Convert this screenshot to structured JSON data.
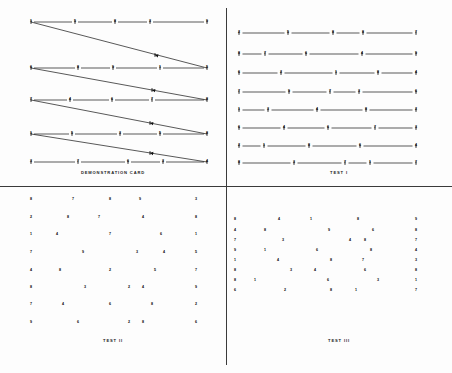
{
  "page": {
    "background": "#fdfdfd",
    "ink": "#111111"
  },
  "panels": {
    "demonstration": {
      "caption": "DEMONSTRATION CARD",
      "description": "Five horizontal numbered rows connected left-to-right, each row joined back to the start of the next row by a long diagonal arrowed line.",
      "rows": [
        {
          "y": 22,
          "nodes": [
            {
              "x": 31,
              "label": "1"
            },
            {
              "x": 75,
              "label": "5"
            },
            {
              "x": 115,
              "label": "8"
            },
            {
              "x": 150,
              "label": "3"
            },
            {
              "x": 207,
              "label": "9"
            }
          ]
        },
        {
          "y": 68,
          "nodes": [
            {
              "x": 31,
              "label": "6"
            },
            {
              "x": 78,
              "label": "8"
            },
            {
              "x": 113,
              "label": "9"
            },
            {
              "x": 160,
              "label": "1"
            },
            {
              "x": 207,
              "label": "5"
            }
          ]
        },
        {
          "y": 100,
          "nodes": [
            {
              "x": 31,
              "label": "7"
            },
            {
              "x": 70,
              "label": "4"
            },
            {
              "x": 112,
              "label": "6"
            },
            {
              "x": 152,
              "label": "7"
            },
            {
              "x": 207,
              "label": "8"
            }
          ]
        },
        {
          "y": 134,
          "nodes": [
            {
              "x": 31,
              "label": "1"
            },
            {
              "x": 72,
              "label": "5"
            },
            {
              "x": 120,
              "label": "3"
            },
            {
              "x": 160,
              "label": "5"
            },
            {
              "x": 207,
              "label": "8"
            }
          ]
        },
        {
          "y": 162,
          "nodes": [
            {
              "x": 31,
              "label": "3"
            },
            {
              "x": 78,
              "label": "7"
            },
            {
              "x": 128,
              "label": "6"
            },
            {
              "x": 163,
              "label": "3"
            },
            {
              "x": 207,
              "label": "4"
            }
          ]
        }
      ],
      "diagonals": [
        {
          "from_x": 207,
          "from_y": 68,
          "to_x": 31,
          "to_y": 22,
          "arrow_x": 155,
          "arrow_y": 55
        },
        {
          "from_x": 207,
          "from_y": 100,
          "to_x": 31,
          "to_y": 68,
          "arrow_x": 152,
          "arrow_y": 90
        },
        {
          "from_x": 207,
          "from_y": 134,
          "to_x": 31,
          "to_y": 100,
          "arrow_x": 150,
          "arrow_y": 123
        },
        {
          "from_x": 207,
          "from_y": 162,
          "to_x": 31,
          "to_y": 134,
          "arrow_x": 150,
          "arrow_y": 153
        }
      ]
    },
    "test_one": {
      "caption": "TEST I",
      "description": "Eight horizontal rows of five numbered nodes joined by straight connecting lines.",
      "rows": [
        {
          "y": 33,
          "nodes": [
            {
              "x": 13,
              "label": "2"
            },
            {
              "x": 62,
              "label": "5"
            },
            {
              "x": 107,
              "label": "8"
            },
            {
              "x": 137,
              "label": "8"
            },
            {
              "x": 190,
              "label": "7"
            }
          ]
        },
        {
          "y": 54,
          "nodes": [
            {
              "x": 13,
              "label": "8"
            },
            {
              "x": 39,
              "label": "7"
            },
            {
              "x": 80,
              "label": "6"
            },
            {
              "x": 136,
              "label": "4"
            },
            {
              "x": 190,
              "label": "9"
            }
          ]
        },
        {
          "y": 73,
          "nodes": [
            {
              "x": 13,
              "label": "6"
            },
            {
              "x": 55,
              "label": "2"
            },
            {
              "x": 110,
              "label": "1"
            },
            {
              "x": 152,
              "label": "8"
            },
            {
              "x": 190,
              "label": "4"
            }
          ]
        },
        {
          "y": 92,
          "nodes": [
            {
              "x": 13,
              "label": "7"
            },
            {
              "x": 63,
              "label": "9"
            },
            {
              "x": 104,
              "label": "7"
            },
            {
              "x": 133,
              "label": "3"
            },
            {
              "x": 190,
              "label": "6"
            }
          ]
        },
        {
          "y": 110,
          "nodes": [
            {
              "x": 13,
              "label": "1"
            },
            {
              "x": 42,
              "label": "3"
            },
            {
              "x": 91,
              "label": "4"
            },
            {
              "x": 140,
              "label": "8"
            },
            {
              "x": 190,
              "label": "2"
            }
          ]
        },
        {
          "y": 128,
          "nodes": [
            {
              "x": 13,
              "label": "6"
            },
            {
              "x": 58,
              "label": "4"
            },
            {
              "x": 102,
              "label": "6"
            },
            {
              "x": 149,
              "label": "7"
            },
            {
              "x": 190,
              "label": "3"
            }
          ]
        },
        {
          "y": 146,
          "nodes": [
            {
              "x": 13,
              "label": "2"
            },
            {
              "x": 38,
              "label": "1"
            },
            {
              "x": 83,
              "label": "8"
            },
            {
              "x": 134,
              "label": "6"
            },
            {
              "x": 190,
              "label": "4"
            }
          ]
        },
        {
          "y": 163,
          "nodes": [
            {
              "x": 13,
              "label": "8"
            },
            {
              "x": 68,
              "label": "3"
            },
            {
              "x": 119,
              "label": "7"
            },
            {
              "x": 144,
              "label": "1"
            },
            {
              "x": 190,
              "label": "7"
            }
          ]
        }
      ]
    },
    "test_two": {
      "caption": "TEST II",
      "description": "Eight rows of scattered unconnected digits, left and right anchor columns present on every row.",
      "rows": [
        {
          "y": 13,
          "nodes": [
            {
              "x": 31,
              "label": "8"
            },
            {
              "x": 73,
              "label": "7"
            },
            {
              "x": 110,
              "label": "8"
            },
            {
              "x": 140,
              "label": "9"
            },
            {
              "x": 196,
              "label": "3"
            }
          ]
        },
        {
          "y": 31,
          "nodes": [
            {
              "x": 31,
              "label": "2"
            },
            {
              "x": 68,
              "label": "8"
            },
            {
              "x": 99,
              "label": "7"
            },
            {
              "x": 143,
              "label": "4"
            },
            {
              "x": 196,
              "label": "8"
            }
          ]
        },
        {
          "y": 48,
          "nodes": [
            {
              "x": 31,
              "label": "1"
            },
            {
              "x": 57,
              "label": "4"
            },
            {
              "x": 110,
              "label": "7"
            },
            {
              "x": 161,
              "label": "6"
            },
            {
              "x": 196,
              "label": "1"
            }
          ]
        },
        {
          "y": 66,
          "nodes": [
            {
              "x": 31,
              "label": "7"
            },
            {
              "x": 83,
              "label": "9"
            },
            {
              "x": 137,
              "label": "3"
            },
            {
              "x": 164,
              "label": "4"
            },
            {
              "x": 196,
              "label": "5"
            }
          ]
        },
        {
          "y": 84,
          "nodes": [
            {
              "x": 31,
              "label": "4"
            },
            {
              "x": 60,
              "label": "8"
            },
            {
              "x": 110,
              "label": "2"
            },
            {
              "x": 155,
              "label": "5"
            },
            {
              "x": 196,
              "label": "7"
            }
          ]
        },
        {
          "y": 101,
          "nodes": [
            {
              "x": 31,
              "label": "8"
            },
            {
              "x": 85,
              "label": "3"
            },
            {
              "x": 129,
              "label": "2"
            },
            {
              "x": 143,
              "label": "4"
            },
            {
              "x": 196,
              "label": "9"
            }
          ]
        },
        {
          "y": 118,
          "nodes": [
            {
              "x": 31,
              "label": "7"
            },
            {
              "x": 63,
              "label": "4"
            },
            {
              "x": 110,
              "label": "6"
            },
            {
              "x": 152,
              "label": "8"
            },
            {
              "x": 196,
              "label": "2"
            }
          ]
        },
        {
          "y": 136,
          "nodes": [
            {
              "x": 31,
              "label": "9"
            },
            {
              "x": 78,
              "label": "6"
            },
            {
              "x": 129,
              "label": "2"
            },
            {
              "x": 143,
              "label": "8"
            },
            {
              "x": 196,
              "label": "6"
            }
          ]
        }
      ]
    },
    "test_three": {
      "caption": "TEST III",
      "description": "Eight closely spaced rows of scattered digits occupying the upper half of the quadrant, with fixed left and right anchor columns.",
      "rows": [
        {
          "y": 33,
          "nodes": [
            {
              "x": 9,
              "label": "8"
            },
            {
              "x": 53,
              "label": "4"
            },
            {
              "x": 85,
              "label": "1"
            },
            {
              "x": 132,
              "label": "8"
            },
            {
              "x": 190,
              "label": "9"
            }
          ]
        },
        {
          "y": 44,
          "nodes": [
            {
              "x": 9,
              "label": "4"
            },
            {
              "x": 39,
              "label": "8"
            },
            {
              "x": 103,
              "label": "9"
            },
            {
              "x": 147,
              "label": "6"
            },
            {
              "x": 190,
              "label": "8"
            }
          ]
        },
        {
          "y": 54,
          "nodes": [
            {
              "x": 9,
              "label": "7"
            },
            {
              "x": 57,
              "label": "3"
            },
            {
              "x": 124,
              "label": "4"
            },
            {
              "x": 139,
              "label": "8"
            },
            {
              "x": 190,
              "label": "7"
            }
          ]
        },
        {
          "y": 64,
          "nodes": [
            {
              "x": 9,
              "label": "9"
            },
            {
              "x": 39,
              "label": "1"
            },
            {
              "x": 91,
              "label": "6"
            },
            {
              "x": 145,
              "label": "8"
            },
            {
              "x": 190,
              "label": "4"
            }
          ]
        },
        {
          "y": 74,
          "nodes": [
            {
              "x": 9,
              "label": "1"
            },
            {
              "x": 52,
              "label": "4"
            },
            {
              "x": 105,
              "label": "8"
            },
            {
              "x": 137,
              "label": "7"
            },
            {
              "x": 190,
              "label": "3"
            }
          ]
        },
        {
          "y": 84,
          "nodes": [
            {
              "x": 9,
              "label": "8"
            },
            {
              "x": 65,
              "label": "3"
            },
            {
              "x": 89,
              "label": "4"
            },
            {
              "x": 139,
              "label": "6"
            },
            {
              "x": 190,
              "label": "8"
            }
          ]
        },
        {
          "y": 94,
          "nodes": [
            {
              "x": 9,
              "label": "8"
            },
            {
              "x": 29,
              "label": "1"
            },
            {
              "x": 102,
              "label": "6"
            },
            {
              "x": 152,
              "label": "3"
            },
            {
              "x": 190,
              "label": "1"
            }
          ]
        },
        {
          "y": 104,
          "nodes": [
            {
              "x": 9,
              "label": "6"
            },
            {
              "x": 59,
              "label": "2"
            },
            {
              "x": 105,
              "label": "8"
            },
            {
              "x": 130,
              "label": "1"
            },
            {
              "x": 190,
              "label": "7"
            }
          ]
        }
      ]
    }
  }
}
